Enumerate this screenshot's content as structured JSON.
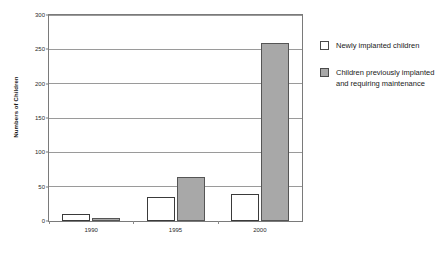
{
  "chart_data": {
    "type": "bar",
    "title": "",
    "xlabel": "",
    "ylabel": "Numbers of Children",
    "categories": [
      "1990",
      "1995",
      "2000"
    ],
    "series": [
      {
        "name": "Newly implanted children",
        "color": "#ffffff",
        "values": [
          10,
          35,
          39
        ]
      },
      {
        "name": "Children previously implanted and requiring maintenance",
        "color": "#a8a8a8",
        "values": [
          4,
          64,
          259
        ]
      }
    ],
    "ylim": [
      0,
      300
    ],
    "yticks": [
      0,
      50,
      100,
      150,
      200,
      250,
      300
    ],
    "ytick_labels": [
      "0",
      "50",
      "100",
      "150",
      "200",
      "250",
      "300"
    ],
    "grid": "horizontal",
    "legend_position": "right"
  },
  "legend": {
    "items": [
      {
        "label": "Newly implanted children"
      },
      {
        "label": "Children previously implanted and requiring maintenance"
      }
    ]
  }
}
